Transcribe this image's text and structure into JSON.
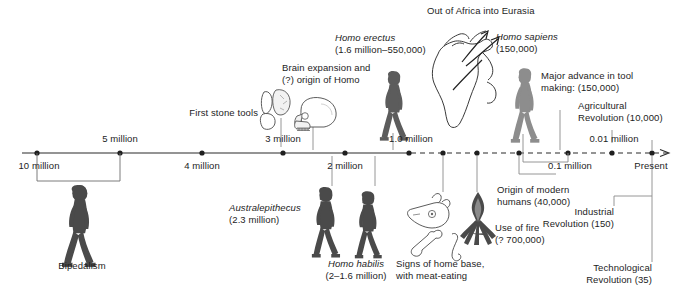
{
  "figure": {
    "background": "#ffffff",
    "axis_color": "#2b2b2b",
    "leader_color": "#8a8a8a"
  },
  "axis": {
    "ticks": [
      {
        "label": "10 million",
        "x": 37,
        "position": "below",
        "solid": true
      },
      {
        "label": "5 million",
        "x": 120,
        "position": "above",
        "solid": true
      },
      {
        "label": "4 million",
        "x": 202,
        "position": "below",
        "solid": true
      },
      {
        "label": "3 million",
        "x": 283,
        "position": "above",
        "solid": true
      },
      {
        "label": "2 million",
        "x": 345,
        "position": "below",
        "solid": true
      },
      {
        "label": "1.0 million",
        "x": 409,
        "position": "above",
        "solid": true
      },
      {
        "label": "",
        "x": 443,
        "position": "none",
        "solid": false
      },
      {
        "label": "",
        "x": 477,
        "position": "none",
        "solid": false
      },
      {
        "label": "",
        "x": 519,
        "position": "none",
        "solid": false
      },
      {
        "label": "0.1 million",
        "x": 568,
        "position": "below",
        "solid": false
      },
      {
        "label": "0.01 million",
        "x": 612,
        "position": "above",
        "solid": false
      },
      {
        "label": "Present",
        "x": 652,
        "position": "below",
        "solid": false
      }
    ],
    "extra_tick_labels": {
      "one_million": "1.0 million",
      "tenth_million": "0.1 million",
      "hundredth_million": "0.01 million",
      "present": "Present"
    }
  },
  "annotations": {
    "bipedalism": "Bipedalism",
    "first_stone_tools": "First stone tools",
    "brain_expansion_line1": "Brain expansion and",
    "brain_expansion_line2": "(?) origin of Homo",
    "brain_expansion_italic_word": "Homo",
    "homo_erectus_name": "Homo erectus",
    "homo_erectus_dates": "(1.6 million–550,000)",
    "out_of_africa": "Out of Africa into Eurasia",
    "homo_sapiens_name": "Homo sapiens",
    "homo_sapiens_dates": "(150,000)",
    "tool_making_line1": "Major advance in tool",
    "tool_making_line2": "making: (150,000)",
    "agricultural_line1": "Agricultural",
    "agricultural_line2": "Revolution (10,000)",
    "industrial_line1": "Industrial",
    "industrial_line2": "Revolution (150)",
    "technological_line1": "Technological",
    "technological_line2": "Revolution (35)",
    "australepithecus_name": "Australepithecus",
    "australepithecus_dates": "(2.3 million)",
    "homo_habilis_name": "Homo habilis",
    "homo_habilis_dates": "(2–1.6 million)",
    "home_base_line1": "Signs of home base,",
    "home_base_line2": "with meat-eating",
    "use_of_fire_line1": "Use of fire",
    "use_of_fire_line2": "(? 700,000)",
    "origin_modern_line1": "Origin of modern",
    "origin_modern_line2": "humans (40,000)"
  },
  "icons": {
    "bipedal_hominid": "walking-hominid-figure",
    "stone_tools": "stone-tool-flakes",
    "skull": "hominid-skull",
    "erectus_figure": "walking-hominid-figure",
    "africa_map": "africa-map-outline",
    "migration_arrows": "migration-arrows",
    "sapiens_figure": "walking-human-figure",
    "australepithecus_figure": "walking-hominid-figure",
    "habilis_figure": "walking-hominid-figure",
    "animal_remains": "skull-and-bones",
    "campfire": "campfire-flame"
  }
}
